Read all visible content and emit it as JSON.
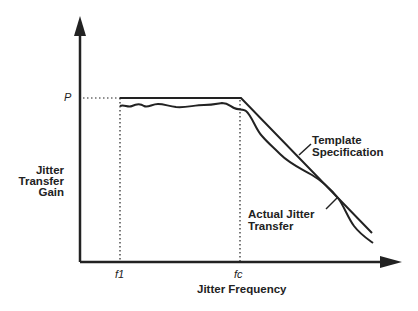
{
  "diagram": {
    "y_axis": {
      "label_lines": [
        "Jitter",
        "Transfer",
        "Gain"
      ],
      "tick_label": "P"
    },
    "x_axis": {
      "label": "Jitter Frequency",
      "tick_labels": [
        "f1",
        "fc"
      ]
    },
    "curves": {
      "template": {
        "label_lines": [
          "Template",
          "Specification"
        ]
      },
      "actual": {
        "label_lines": [
          "Actual Jitter",
          "Transfer"
        ]
      }
    },
    "colors": {
      "line": "#222222",
      "background": "#ffffff"
    }
  }
}
